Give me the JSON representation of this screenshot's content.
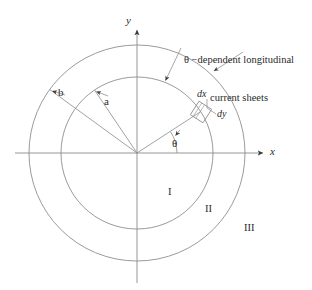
{
  "figure": {
    "title_label": "theta-dependent-longitudinal-current-sheets-annulus",
    "colors": {
      "stroke": "#7a7a7a",
      "axis": "#8a8a8a",
      "text": "#2a2a2a",
      "background": "#ffffff"
    },
    "axes": {
      "x_label": "x",
      "y_label": "y"
    },
    "radii": {
      "inner_label": "a",
      "outer_label": "b"
    },
    "angle": {
      "theta_label": "θ"
    },
    "differential": {
      "dx_label": "dx",
      "dy_label": "dy"
    },
    "regions": [
      {
        "label": "I"
      },
      {
        "label": "II"
      },
      {
        "label": "III"
      }
    ],
    "caption": {
      "line1": "θ −dependent longitudinal",
      "line2": "current sheets"
    },
    "geometry": {
      "origin_x": 137,
      "origin_y": 153,
      "inner_radius": 76,
      "outer_radius": 108,
      "theta_degrees": 33,
      "radius_a_angle_degrees": 124,
      "radius_b_angle_degrees": 144
    }
  }
}
